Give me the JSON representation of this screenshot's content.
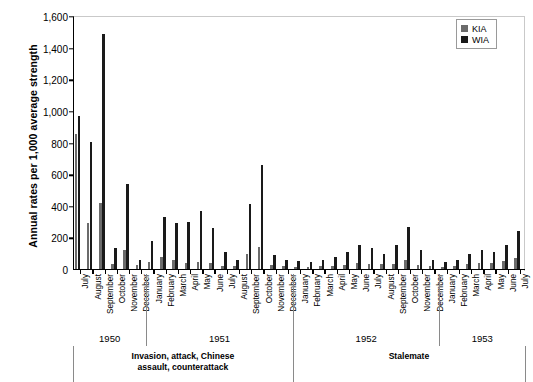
{
  "chart_data": {
    "type": "bar",
    "title": "",
    "xlabel": "",
    "ylabel": "Annual rates per 1,000 average strength",
    "ylim": [
      0,
      1600
    ],
    "yticks": [
      0,
      200,
      400,
      600,
      800,
      1000,
      1200,
      1400,
      1600
    ],
    "ytick_labels": [
      "0",
      "200",
      "400",
      "600",
      "800",
      "1,000",
      "1,200",
      "1,400",
      "1,600"
    ],
    "grid": false,
    "legend": {
      "position": "top-right",
      "entries": [
        {
          "name": "KIA",
          "color": "#6b6b6b"
        },
        {
          "name": "WIA",
          "color": "#1a1a1a"
        }
      ]
    },
    "categories": [
      "July",
      "August",
      "September",
      "October",
      "November",
      "December",
      "January",
      "February",
      "March",
      "April",
      "May",
      "June",
      "July",
      "August",
      "September",
      "October",
      "November",
      "December",
      "January",
      "February",
      "March",
      "April",
      "May",
      "June",
      "July",
      "August",
      "September",
      "October",
      "November",
      "December",
      "January",
      "February",
      "March",
      "April",
      "May",
      "June",
      "July"
    ],
    "series": [
      {
        "name": "KIA",
        "color": "#6b6b6b",
        "values": [
          855,
          290,
          415,
          30,
          120,
          25,
          45,
          75,
          55,
          40,
          45,
          35,
          20,
          20,
          95,
          140,
          25,
          20,
          15,
          15,
          18,
          20,
          25,
          35,
          30,
          32,
          30,
          60,
          28,
          18,
          15,
          20,
          30,
          40,
          35,
          50,
          70
        ]
      },
      {
        "name": "WIA",
        "color": "#1a1a1a",
        "values": [
          965,
          805,
          1485,
          135,
          535,
          60,
          175,
          330,
          290,
          300,
          365,
          260,
          110,
          55,
          410,
          660,
          90,
          60,
          50,
          45,
          55,
          75,
          105,
          150,
          130,
          95,
          155,
          265,
          120,
          55,
          45,
          55,
          95,
          120,
          105,
          155,
          240
        ]
      }
    ],
    "year_groups": [
      {
        "label": "1950",
        "start": 0,
        "count": 6
      },
      {
        "label": "1951",
        "start": 6,
        "count": 12
      },
      {
        "label": "1952",
        "start": 18,
        "count": 12
      },
      {
        "label": "1953",
        "start": 30,
        "count": 7
      }
    ],
    "phase_annotations": [
      {
        "label": "Invasion, attack, Chinese\nassault, counterattack",
        "start": 0,
        "count": 18
      },
      {
        "label": "Stalemate",
        "start": 18,
        "count": 19
      }
    ]
  }
}
